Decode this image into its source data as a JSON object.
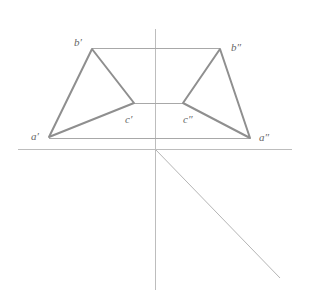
{
  "diagram": {
    "type": "orthographic-projection",
    "colors": {
      "axis": "#b8b8b8",
      "thin": "#9a9a9a",
      "edge": "#8c8c8c",
      "label": "#666666"
    },
    "labels": {
      "b1": "b′",
      "c1": "c′",
      "a1": "a′",
      "b2": "b″",
      "c2": "c″",
      "a2": "a″"
    },
    "points": {
      "b1": [
        92,
        49
      ],
      "c1": [
        134,
        103
      ],
      "a1": [
        49,
        137
      ],
      "b2": [
        220,
        49
      ],
      "c2": [
        183,
        103
      ],
      "a2": [
        250,
        138
      ]
    }
  }
}
